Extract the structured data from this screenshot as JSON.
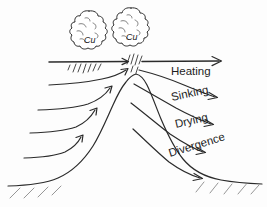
{
  "figure": {
    "type": "schematic-diagram",
    "background_color": "#fdfdfd",
    "ink_color": "#2b2b2b",
    "width": 267,
    "height": 207
  },
  "clouds": [
    {
      "label": "Cu",
      "name": "cumulus-cloud-left",
      "x": 90,
      "y": 33
    },
    {
      "label": "Cu",
      "name": "cumulus-cloud-right",
      "x": 131,
      "y": 30
    }
  ],
  "upper_flow": {
    "name": "upper-level-flow-line",
    "label": "Heating",
    "direction": "left-to-right"
  },
  "flow_labels": [
    {
      "id": "heating",
      "text": "Heating",
      "x": 171,
      "y": 75,
      "rotation": 0
    },
    {
      "id": "sinking",
      "text": "Sinking",
      "x": 172,
      "y": 101,
      "rotation": -12
    },
    {
      "id": "drying",
      "text": "Drying",
      "x": 176,
      "y": 128,
      "rotation": -13
    },
    {
      "id": "divergence",
      "text": "Divergence",
      "x": 170,
      "y": 157,
      "rotation": -17
    }
  ],
  "upwind_arrows": {
    "name": "upslope-flow-arrows",
    "count": 4,
    "description": "curved arrows rising from lower left toward the summit"
  },
  "downwind_arrows": {
    "name": "downslope-flow-arrows",
    "count": 4,
    "description": "curved arrows descending from the summit toward lower right"
  },
  "terrain": {
    "name": "mountain-profile",
    "description": "bell-shaped mountain with ground hatching at both bases"
  },
  "precipitation": {
    "name": "precipitation-streaks",
    "description": "rain shafts falling beneath each cumulus cloud"
  }
}
